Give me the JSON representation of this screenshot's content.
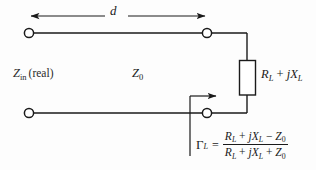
{
  "figure": {
    "background_color": "#fdfdfd",
    "line_color": "#1a1a1a",
    "text_color": "#1a1a1a"
  },
  "labels": {
    "length": "d",
    "input_impedance": {
      "symbol": "Z",
      "subscript": "in",
      "qualifier": "(real)"
    },
    "characteristic_impedance": {
      "symbol": "Z",
      "subscript": "0"
    },
    "load_impedance": {
      "resistance_symbol": "R",
      "resistance_subscript": "L",
      "plus": "+",
      "reactance_j": "j",
      "reactance_symbol": "X",
      "reactance_subscript": "L"
    },
    "reflection_coefficient": {
      "symbol": "Γ",
      "subscript": "L",
      "equals": "=",
      "numerator": {
        "r_symbol": "R",
        "r_sub": "L",
        "plus": "+",
        "j": "j",
        "x_symbol": "X",
        "x_sub": "L",
        "minus": "−",
        "z_symbol": "Z",
        "z_sub": "0"
      },
      "denominator": {
        "r_symbol": "R",
        "r_sub": "L",
        "plus": "+",
        "j": "j",
        "x_symbol": "X",
        "x_sub": "L",
        "plus2": "+",
        "z_symbol": "Z",
        "z_sub": "0"
      }
    }
  },
  "components": {
    "load_resistor": {
      "shape": "rectangle",
      "orientation": "vertical"
    },
    "terminals": [
      {
        "name": "input-top",
        "x": 29,
        "y": 33
      },
      {
        "name": "output-top",
        "x": 207,
        "y": 33
      },
      {
        "name": "input-bottom",
        "x": 29,
        "y": 113
      },
      {
        "name": "output-bottom",
        "x": 207,
        "y": 113
      }
    ]
  },
  "icons": {
    "dimension_arrow": "double-headed-arrow-icon",
    "gamma_arrow": "right-arrow-icon",
    "terminal": "open-circle-terminal-icon"
  }
}
